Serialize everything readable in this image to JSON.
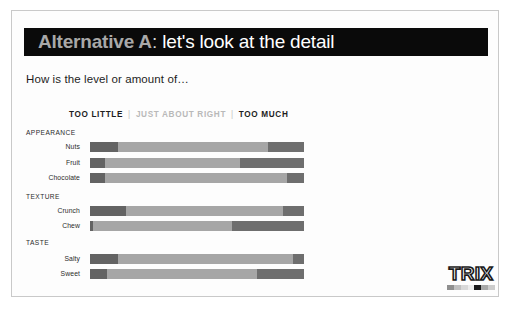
{
  "slide": {
    "title_main": "Alternative A",
    "title_colon": ":",
    "title_rest": " let's look at the detail",
    "subtitle": "How is the level or amount of…"
  },
  "legend": {
    "too_little": "TOO LITTLE",
    "separator": "|",
    "just_about_right": "JUST ABOUT RIGHT",
    "too_much": "TOO MUCH"
  },
  "logo": {
    "word": "TRIX",
    "swatch_colors": [
      "#8f8f8f",
      "#c0c0c0",
      "#d9d9d9",
      "#ededed",
      "#1a1a1a",
      "#a8a8a8",
      "#cccccc"
    ]
  },
  "colors": {
    "title_bar": "#0a0a0a",
    "too_little": "#636363",
    "just_about_right": "#a6a6a6",
    "too_much": "#6e6e6e",
    "border": "#c9c9c9"
  },
  "chart_data": {
    "type": "bar",
    "title": "How is the level or amount of…",
    "xlabel": "",
    "ylabel": "",
    "orientation": "horizontal",
    "stacked": true,
    "percent": true,
    "xlim": [
      0,
      100
    ],
    "grid": false,
    "legend_position": "top",
    "series": [
      {
        "name": "TOO LITTLE",
        "color": "#636363",
        "values": [
          13,
          7,
          7,
          17,
          1.5,
          13,
          8
        ]
      },
      {
        "name": "JUST ABOUT RIGHT",
        "color": "#a6a6a6",
        "values": [
          70,
          63,
          85,
          73,
          65,
          82,
          70
        ]
      },
      {
        "name": "TOO MUCH",
        "color": "#6e6e6e",
        "values": [
          17,
          30,
          8,
          10,
          33.5,
          5,
          22
        ]
      }
    ],
    "groups": [
      {
        "label": "APPEARANCE",
        "categories": [
          "Nuts",
          "Fruit",
          "Chocolate"
        ]
      },
      {
        "label": "TEXTURE",
        "categories": [
          "Crunch",
          "Chew"
        ]
      },
      {
        "label": "TASTE",
        "categories": [
          "Salty",
          "Sweet"
        ]
      }
    ],
    "categories": [
      "Nuts",
      "Fruit",
      "Chocolate",
      "Crunch",
      "Chew",
      "Salty",
      "Sweet"
    ],
    "rows": [
      {
        "group": "APPEARANCE",
        "label": "Nuts",
        "too_little": 13,
        "just_about_right": 70,
        "too_much": 17
      },
      {
        "group": "APPEARANCE",
        "label": "Fruit",
        "too_little": 7,
        "just_about_right": 63,
        "too_much": 30
      },
      {
        "group": "APPEARANCE",
        "label": "Chocolate",
        "too_little": 7,
        "just_about_right": 85,
        "too_much": 8
      },
      {
        "group": "TEXTURE",
        "label": "Crunch",
        "too_little": 17,
        "just_about_right": 73,
        "too_much": 10
      },
      {
        "group": "TEXTURE",
        "label": "Chew",
        "too_little": 1.5,
        "just_about_right": 65,
        "too_much": 33.5
      },
      {
        "group": "TASTE",
        "label": "Salty",
        "too_little": 13,
        "just_about_right": 82,
        "too_much": 5
      },
      {
        "group": "TASTE",
        "label": "Sweet",
        "too_little": 8,
        "just_about_right": 70,
        "too_much": 22
      }
    ]
  },
  "layout": {
    "group_tops": {
      "APPEARANCE": 118,
      "TEXTURE": 182,
      "TASTE": 228
    },
    "row_tops": [
      130,
      146,
      161,
      194,
      209,
      242,
      257
    ]
  }
}
